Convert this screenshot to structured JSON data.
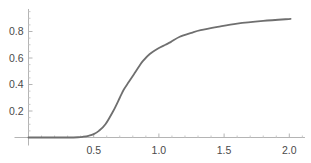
{
  "chart_data": {
    "type": "line",
    "title": "",
    "xlabel": "",
    "ylabel": "",
    "xlim": [
      0,
      2.12
    ],
    "ylim": [
      0,
      0.97
    ],
    "x_ticks": [
      0.5,
      1.0,
      1.5,
      2.0
    ],
    "x_tick_labels": [
      "0.5",
      "1.0",
      "1.5",
      "2.0"
    ],
    "x_minor_step": 0.1,
    "y_ticks": [
      0.2,
      0.4,
      0.6,
      0.8
    ],
    "y_tick_labels": [
      "0.2",
      "0.4",
      "0.6",
      "0.8"
    ],
    "y_minor_step": 0.05,
    "grid": false,
    "legend": "none",
    "series": [
      {
        "name": "curve",
        "color": "#6f6f6f",
        "x": [
          0.0,
          0.1,
          0.2,
          0.3,
          0.38,
          0.42,
          0.46,
          0.5,
          0.54,
          0.59,
          0.65,
          0.7,
          0.73,
          0.77,
          0.81,
          0.85,
          0.88,
          0.93,
          0.99,
          1.05,
          1.09,
          1.16,
          1.25,
          1.32,
          1.45,
          1.6,
          1.8,
          2.01
        ],
        "y": [
          0.0,
          0.0,
          0.0,
          0.0,
          0.002,
          0.006,
          0.013,
          0.025,
          0.05,
          0.1,
          0.2,
          0.3,
          0.36,
          0.42,
          0.48,
          0.54,
          0.58,
          0.63,
          0.67,
          0.7,
          0.72,
          0.76,
          0.79,
          0.81,
          0.835,
          0.86,
          0.88,
          0.895
        ]
      }
    ]
  }
}
